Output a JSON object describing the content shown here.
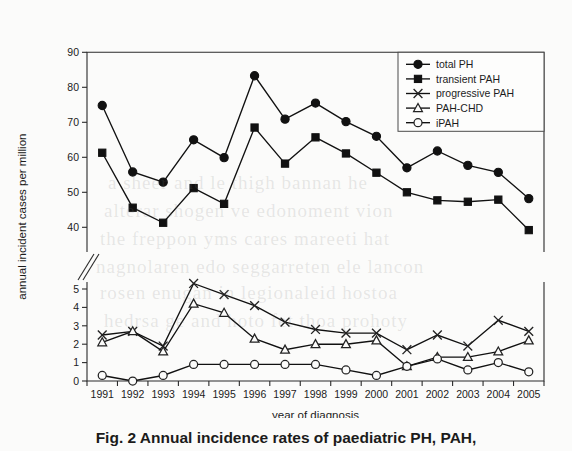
{
  "figure": {
    "caption": "Fig. 2   Annual incidence rates of paediatric PH, PAH,",
    "background_color": "#fbfbfa",
    "ink_color": "#111111"
  },
  "ghost_text": [
    {
      "text": "a sheer and le thigh bannan he",
      "x": 108,
      "y": 172
    },
    {
      "text": "alterar shogen ve edonoment vion",
      "x": 104,
      "y": 200
    },
    {
      "text": "the freppon yms cares mareeti hat",
      "x": 100,
      "y": 228
    },
    {
      "text": "nagnolaren edo seggarreten ele lancon",
      "x": 96,
      "y": 256
    },
    {
      "text": "rosen enugan in legionaleid hostoa",
      "x": 100,
      "y": 282
    },
    {
      "text": "hedrsa ge and hoto fet thoa prohoty",
      "x": 104,
      "y": 310
    }
  ],
  "chart_data": {
    "type": "line",
    "title": "",
    "xlabel": "year of diagnosis",
    "ylabel": "annual incident cases per million",
    "x": [
      1991,
      1992,
      1993,
      1994,
      1995,
      1996,
      1997,
      1998,
      1999,
      2000,
      2001,
      2002,
      2003,
      2004,
      2005
    ],
    "categories": [
      "1991",
      "1992",
      "1993",
      "1994",
      "1995",
      "1996",
      "1997",
      "1998",
      "1999",
      "2000",
      "2001",
      "2002",
      "2003",
      "2004",
      "2005"
    ],
    "axis_break": true,
    "upper_panel": {
      "ylim": [
        40,
        90
      ],
      "yticks": [
        40,
        50,
        60,
        70,
        80,
        90
      ],
      "ytick_labels": [
        "40",
        "50",
        "60",
        "70",
        "80",
        "90"
      ]
    },
    "lower_panel": {
      "ylim": [
        0,
        5
      ],
      "yticks": [
        0,
        1,
        2,
        3,
        4,
        5
      ],
      "ytick_labels": [
        "0",
        "1",
        "2",
        "3",
        "4",
        "5"
      ]
    },
    "grid": false,
    "legend_position": "top-right",
    "series": [
      {
        "name": "total PH",
        "marker": "filled-circle",
        "panel": "upper",
        "values": [
          74.8,
          55.8,
          52.9,
          65.0,
          59.9,
          83.3,
          70.9,
          75.5,
          70.2,
          66.0,
          57.0,
          61.8,
          57.7,
          55.7,
          48.2
        ]
      },
      {
        "name": "transient PAH",
        "marker": "filled-square",
        "panel": "upper",
        "values": [
          61.3,
          45.6,
          41.3,
          51.2,
          46.7,
          68.5,
          58.2,
          65.7,
          61.1,
          55.6,
          50.0,
          47.7,
          47.3,
          47.9,
          39.2
        ]
      },
      {
        "name": "progressive PAH",
        "marker": "cross",
        "panel": "lower",
        "values": [
          2.5,
          2.7,
          1.9,
          5.3,
          4.7,
          4.1,
          3.2,
          2.8,
          2.6,
          2.6,
          1.7,
          2.5,
          1.9,
          3.3,
          2.7
        ]
      },
      {
        "name": "PAH-CHD",
        "marker": "open-triangle",
        "panel": "lower",
        "values": [
          2.1,
          2.7,
          1.6,
          4.2,
          3.7,
          2.3,
          1.7,
          2.0,
          2.0,
          2.2,
          0.8,
          1.3,
          1.3,
          1.6,
          2.2
        ]
      },
      {
        "name": "iPAH",
        "marker": "open-circle",
        "panel": "lower",
        "values": [
          0.3,
          0.0,
          0.3,
          0.9,
          0.9,
          0.9,
          0.9,
          0.9,
          0.6,
          0.3,
          0.8,
          1.2,
          0.6,
          1.0,
          0.5
        ]
      }
    ]
  }
}
